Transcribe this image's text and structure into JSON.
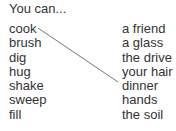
{
  "title": "You can...",
  "verbs": [
    "cook",
    "brush",
    "dig",
    "hug",
    "shake",
    "sweep",
    "fill"
  ],
  "objects": [
    "a friend",
    "a glass",
    "the drive",
    "your hair",
    "dinner",
    "hands",
    "the soil"
  ],
  "matches": [
    {
      "verb": "cook",
      "object": "dinner"
    }
  ],
  "line_color": "#777777"
}
